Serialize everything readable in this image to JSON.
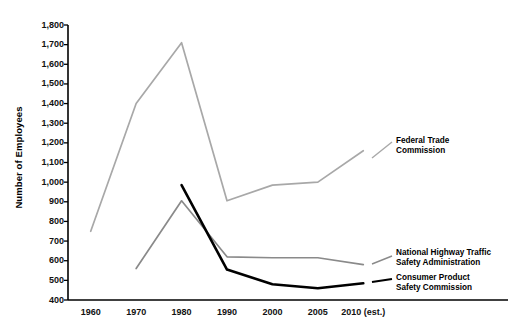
{
  "chart_data": {
    "type": "line",
    "title": "",
    "xlabel": "",
    "ylabel": "Number of Employees",
    "x": [
      "1960",
      "1970",
      "1980",
      "1990",
      "2000",
      "2005",
      "2010 (est.)"
    ],
    "xtick_labels": [
      "1960",
      "1970",
      "1980",
      "1990",
      "2000",
      "2005",
      "2010 (est.)"
    ],
    "ytick_labels": [
      "1,800",
      "1,700",
      "1,600",
      "1,500",
      "1,400",
      "1,300",
      "1,200",
      "1,100",
      "1,000",
      "900",
      "800",
      "700",
      "600",
      "500",
      "400"
    ],
    "ylim": [
      400,
      1800
    ],
    "ytick_step": 100,
    "grid": false,
    "legend_position": "inline-right",
    "series": [
      {
        "name": "Federal Trade Commission",
        "label_line1": "Federal Trade",
        "label_line2": "Commission",
        "color": "#a8a8a8",
        "x": [
          "1960",
          "1970",
          "1980",
          "1990",
          "2000",
          "2005",
          "2010 (est.)"
        ],
        "values": [
          750,
          1400,
          1710,
          905,
          985,
          1000,
          1160
        ]
      },
      {
        "name": "National Highway Traffic Safety Administration",
        "label_line1": "National Highway Traffic",
        "label_line2": "Safety Administration",
        "color": "#8a8a8a",
        "x": [
          "1970",
          "1980",
          "1990",
          "2000",
          "2005",
          "2010 (est.)"
        ],
        "values": [
          560,
          905,
          620,
          615,
          615,
          580
        ]
      },
      {
        "name": "Consumer Product Safety Commission",
        "label_line1": "Consumer Product",
        "label_line2": "Safety Commission",
        "color": "#000000",
        "x": [
          "1980",
          "1990",
          "2000",
          "2005",
          "2010 (est.)"
        ],
        "values": [
          985,
          555,
          480,
          460,
          485
        ]
      }
    ]
  },
  "axis": {
    "ylabel": "Number of Employees"
  }
}
